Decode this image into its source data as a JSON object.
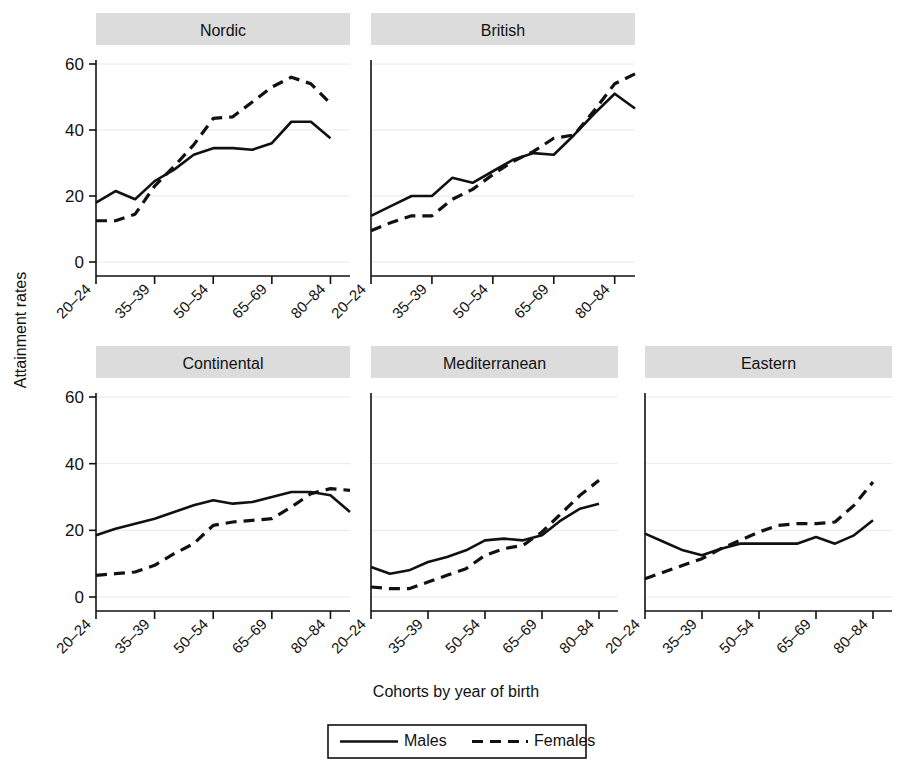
{
  "figure": {
    "background": "#ffffff",
    "ink": "#111111",
    "panel_header_fill": "#dcdcdc",
    "gridline_color": "#e8e8e8"
  },
  "axes": {
    "ylabel": "Attainment rates",
    "xlabel": "Cohorts by year of birth",
    "yticks": [
      "0",
      "20",
      "40",
      "60"
    ],
    "ylim": [
      -3,
      66
    ],
    "xticks": [
      "20–24",
      "35–39",
      "50–54",
      "65–69",
      "80–84"
    ]
  },
  "legend": {
    "position": "bottom-center",
    "entries": [
      {
        "label": "Males",
        "style": "solid"
      },
      {
        "label": "Females",
        "style": "dashed"
      }
    ]
  },
  "chart_data": {
    "type": "line",
    "title": "",
    "subtitle": "",
    "xlabel": "Cohorts by year of birth",
    "ylabel": "Attainment rates",
    "ylim": [
      0,
      60
    ],
    "yticks": [
      0,
      20,
      40,
      60
    ],
    "grid": "horizontal",
    "legend": [
      "Males",
      "Females"
    ],
    "facet_layout": [
      [
        "Nordic",
        "British"
      ],
      [
        "Continental",
        "Mediterranean",
        "Eastern"
      ]
    ],
    "x_categories": [
      "20–24",
      "25–29",
      "30–34",
      "35–39",
      "40–44",
      "45–49",
      "50–54",
      "55–59",
      "60–64",
      "65–69",
      "70–74",
      "75–79",
      "80–84",
      "85–89"
    ],
    "x_tick_labels": [
      "20–24",
      "35–39",
      "50–54",
      "65–69",
      "80–84"
    ],
    "x_tick_indices": [
      0,
      3,
      6,
      9,
      12
    ],
    "panels": [
      {
        "name": "Nordic",
        "series": [
          {
            "name": "Males",
            "style": "solid",
            "values": [
              18.0,
              21.5,
              19.0,
              24.5,
              28.0,
              32.5,
              34.5,
              34.5,
              34.0,
              36.0,
              42.5,
              42.5,
              37.5
            ]
          },
          {
            "name": "Females",
            "style": "dashed",
            "values": [
              12.5,
              12.5,
              14.5,
              23.0,
              29.0,
              35.5,
              43.5,
              44.0,
              48.5,
              53.0,
              56.0,
              54.0,
              48.0
            ]
          }
        ]
      },
      {
        "name": "British",
        "series": [
          {
            "name": "Males",
            "style": "solid",
            "values": [
              14.0,
              17.0,
              20.0,
              20.0,
              25.5,
              24.0,
              27.5,
              31.0,
              33.0,
              32.5,
              38.5,
              45.0,
              51.0,
              46.5
            ]
          },
          {
            "name": "Females",
            "style": "dashed",
            "values": [
              9.5,
              12.0,
              14.0,
              14.0,
              19.0,
              22.0,
              26.5,
              30.5,
              33.5,
              37.5,
              38.5,
              46.0,
              54.0,
              57.0
            ]
          }
        ]
      },
      {
        "name": "Continental",
        "series": [
          {
            "name": "Males",
            "style": "solid",
            "values": [
              18.5,
              20.5,
              22.0,
              23.5,
              25.5,
              27.5,
              29.0,
              28.0,
              28.5,
              30.0,
              31.5,
              31.5,
              30.5,
              25.5
            ]
          },
          {
            "name": "Females",
            "style": "dashed",
            "values": [
              6.5,
              7.0,
              7.5,
              9.5,
              13.0,
              16.0,
              21.5,
              22.5,
              23.0,
              23.5,
              27.0,
              31.0,
              32.5,
              32.0
            ]
          }
        ]
      },
      {
        "name": "Mediterranean",
        "series": [
          {
            "name": "Males",
            "style": "solid",
            "values": [
              9.0,
              7.0,
              8.0,
              10.5,
              12.0,
              14.0,
              17.0,
              17.5,
              17.0,
              18.5,
              23.0,
              26.5,
              28.0
            ]
          },
          {
            "name": "Females",
            "style": "dashed",
            "values": [
              3.0,
              2.5,
              2.5,
              4.5,
              6.5,
              8.5,
              12.5,
              14.5,
              15.5,
              19.5,
              25.0,
              30.5,
              35.0
            ]
          }
        ]
      },
      {
        "name": "Eastern",
        "series": [
          {
            "name": "Males",
            "style": "solid",
            "values": [
              19.0,
              16.5,
              14.0,
              12.5,
              14.5,
              16.0,
              16.0,
              16.0,
              16.0,
              18.0,
              16.0,
              18.5,
              23.0
            ]
          },
          {
            "name": "Females",
            "style": "dashed",
            "values": [
              5.5,
              7.5,
              9.5,
              11.5,
              14.5,
              17.0,
              19.5,
              21.5,
              22.0,
              22.0,
              22.5,
              27.5,
              34.5
            ]
          }
        ]
      }
    ]
  }
}
